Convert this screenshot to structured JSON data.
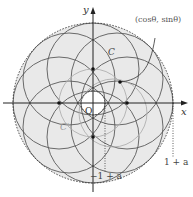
{
  "diagram": {
    "axes": {
      "x_label": "x",
      "y_label": "y",
      "origin_label": "O"
    },
    "labels": {
      "point": "(cosθ, sinθ)",
      "curve_c": "C",
      "curve_c_prime": "C′",
      "inner_value": "−1 + a",
      "outer_value": "1 + a"
    },
    "colors": {
      "fill": "#e8e8e8",
      "circle_stroke": "#555555",
      "light_circle_stroke": "#aaaaaa",
      "axis": "#222222"
    },
    "geometry": {
      "origin_px": [
        93,
        103
      ],
      "unit_radius_px": 34,
      "a_radius_px": 46,
      "outer_radius_px": 80,
      "inner_radius_px": 12
    }
  }
}
